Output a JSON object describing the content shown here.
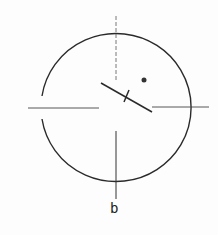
{
  "figure": {
    "label": "b",
    "stroke_color": "#2a2a2a",
    "axis_color": "#444444",
    "circle": {
      "cx": 116,
      "cy": 108,
      "r": 74
    },
    "dot": {
      "cx": 144,
      "cy": 80,
      "r": 2.5
    }
  }
}
